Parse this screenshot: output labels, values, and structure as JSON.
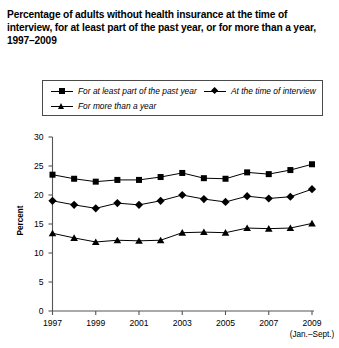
{
  "title": "Percentage of adults without health insurance at the time of interview, for at least part of the past year, or for more than a year, 1997–2009",
  "legend": {
    "items": [
      {
        "label": "For at least part of the past year",
        "marker": "square-marker-icon"
      },
      {
        "label": "At the time of interview",
        "marker": "diamond-marker-icon"
      },
      {
        "label": "For more than a year",
        "marker": "triangle-marker-icon"
      }
    ]
  },
  "axes": {
    "y_title": "Percent",
    "y_ticks": [
      "30",
      "25",
      "20",
      "15",
      "10",
      "5",
      "0"
    ],
    "x_ticks": [
      "1997",
      "1999",
      "2001",
      "2003",
      "2005",
      "2007",
      "2009"
    ],
    "x_note": "(Jan.–Sept.)"
  },
  "colors": {
    "line": "#000000",
    "marker": "#000000",
    "axis": "#555555",
    "legend_border": "#4a4a4a",
    "background": "#ffffff"
  },
  "chart_data": {
    "type": "line",
    "title": "Percentage of adults without health insurance at the time of interview, for at least part of the past year, or for more than a year, 1997–2009",
    "xlabel": "",
    "ylabel": "Percent",
    "ylim": [
      0,
      30
    ],
    "xlim": [
      1997,
      2009
    ],
    "yticks": [
      0,
      5,
      10,
      15,
      20,
      25,
      30
    ],
    "xticks": [
      1997,
      1999,
      2001,
      2003,
      2005,
      2007,
      2009
    ],
    "grid": false,
    "legend_position": "top",
    "x": [
      1997,
      1998,
      1999,
      2000,
      2001,
      2002,
      2003,
      2004,
      2005,
      2006,
      2007,
      2008,
      2009
    ],
    "series": [
      {
        "name": "For at least part of the past year",
        "marker": "square",
        "values": [
          23.5,
          22.8,
          22.3,
          22.6,
          22.6,
          23.1,
          23.8,
          22.9,
          22.8,
          23.9,
          23.6,
          24.3,
          25.3
        ]
      },
      {
        "name": "At the time of interview",
        "marker": "diamond",
        "values": [
          19.0,
          18.3,
          17.7,
          18.6,
          18.3,
          19.0,
          20.0,
          19.3,
          18.8,
          19.8,
          19.4,
          19.7,
          21.0
        ]
      },
      {
        "name": "For more than a year",
        "marker": "triangle",
        "values": [
          13.4,
          12.6,
          11.9,
          12.2,
          12.1,
          12.2,
          13.5,
          13.6,
          13.5,
          14.3,
          14.2,
          14.3,
          15.1
        ]
      }
    ]
  }
}
